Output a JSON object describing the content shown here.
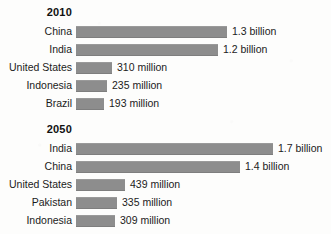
{
  "chart_data": {
    "type": "bar",
    "title": "",
    "xlabel": "",
    "ylabel": "",
    "orientation": "horizontal",
    "grid": false,
    "legend": "none",
    "axis_visible": false,
    "unit": "people",
    "bar_color": "#8d8d8d",
    "background_color": "#fdfdfc",
    "text_color": "#1b1b1b",
    "xlim": [
      0,
      1700000000
    ],
    "panels": [
      {
        "heading": "2010",
        "categories": [
          "China",
          "India",
          "United States",
          "Indonesia",
          "Brazil"
        ],
        "values": [
          1300000000,
          1200000000,
          310000000,
          235000000,
          193000000
        ],
        "value_labels": [
          "1.3 billion",
          "1.2 billion",
          "310 million",
          "235 million",
          "193 million"
        ],
        "bars": [
          {
            "label": "China",
            "value_label": "1.3 billion",
            "value": 1300000000,
            "bar_px": 151
          },
          {
            "label": "India",
            "value_label": "1.2 billion",
            "value": 1200000000,
            "bar_px": 142
          },
          {
            "label": "United States",
            "value_label": "310 million",
            "value": 310000000,
            "bar_px": 36
          },
          {
            "label": "Indonesia",
            "value_label": "235 million",
            "value": 235000000,
            "bar_px": 31
          },
          {
            "label": "Brazil",
            "value_label": "193 million",
            "value": 193000000,
            "bar_px": 28
          }
        ]
      },
      {
        "heading": "2050",
        "categories": [
          "India",
          "China",
          "United States",
          "Pakistan",
          "Indonesia"
        ],
        "values": [
          1700000000,
          1400000000,
          439000000,
          335000000,
          309000000
        ],
        "value_labels": [
          "1.7 billion",
          "1.4 billion",
          "439 million",
          "335 million",
          "309 million"
        ],
        "bars": [
          {
            "label": "India",
            "value_label": "1.7 billion",
            "value": 1700000000,
            "bar_px": 197
          },
          {
            "label": "China",
            "value_label": "1.4 billion",
            "value": 1400000000,
            "bar_px": 164
          },
          {
            "label": "United States",
            "value_label": "439 million",
            "value": 439000000,
            "bar_px": 49
          },
          {
            "label": "Pakistan",
            "value_label": "335 million",
            "value": 335000000,
            "bar_px": 41
          },
          {
            "label": "Indonesia",
            "value_label": "309 million",
            "value": 309000000,
            "bar_px": 39
          }
        ]
      }
    ]
  }
}
